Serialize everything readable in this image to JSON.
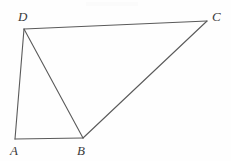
{
  "figure": {
    "width": 231,
    "height": 161,
    "background_color": "#fefefe",
    "stroke_color": "#5a5a5a",
    "stroke_width": 1,
    "label_color": "#3b3b3b",
    "vertices": [
      {
        "id": "A",
        "label": "A",
        "x": 15,
        "y": 139,
        "label_x": 10,
        "label_y": 144
      },
      {
        "id": "B",
        "label": "B",
        "x": 83,
        "y": 138,
        "label_x": 77,
        "label_y": 144
      },
      {
        "id": "C",
        "label": "C",
        "x": 207,
        "y": 21,
        "label_x": 212,
        "label_y": 10
      },
      {
        "id": "D",
        "label": "D",
        "x": 24,
        "y": 29,
        "label_x": 18,
        "label_y": 10
      }
    ],
    "edges": [
      {
        "id": "AD",
        "from": "A",
        "to": "D",
        "x1": 15,
        "y1": 139,
        "x2": 24,
        "y2": 29
      },
      {
        "id": "DC",
        "from": "D",
        "to": "C",
        "x1": 24,
        "y1": 29,
        "x2": 207,
        "y2": 21
      },
      {
        "id": "CB",
        "from": "C",
        "to": "B",
        "x1": 207,
        "y1": 21,
        "x2": 83,
        "y2": 138
      },
      {
        "id": "BA",
        "from": "B",
        "to": "A",
        "x1": 83,
        "y1": 138,
        "x2": 15,
        "y2": 139
      },
      {
        "id": "DB",
        "from": "D",
        "to": "B",
        "x1": 24,
        "y1": 29,
        "x2": 83,
        "y2": 138
      }
    ]
  }
}
